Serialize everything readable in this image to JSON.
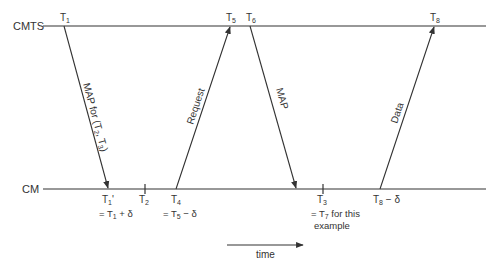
{
  "lines": {
    "cmts_label": "CMTS",
    "cm_label": "CM"
  },
  "top_marks": {
    "t1": {
      "base": "T",
      "sub": "1"
    },
    "t5": {
      "base": "T",
      "sub": "5"
    },
    "t6": {
      "base": "T",
      "sub": "6"
    },
    "t8": {
      "base": "T",
      "sub": "8"
    }
  },
  "bottom_marks": {
    "t1p": {
      "base": "T",
      "sub": "1",
      "suffix": "'",
      "note_prefix": "= T",
      "note_sub": "1",
      "note_suffix": " + δ"
    },
    "t2": {
      "base": "T",
      "sub": "2"
    },
    "t4": {
      "base": "T",
      "sub": "4",
      "note_prefix": "= T",
      "note_sub": "5",
      "note_suffix": " − δ"
    },
    "t3": {
      "base": "T",
      "sub": "3",
      "note_prefix": "= T",
      "note_sub": "7",
      "note_suffix": " for this",
      "note_line2": "example"
    },
    "t8d": {
      "base": "T",
      "sub": "8",
      "suffix": " − δ"
    }
  },
  "messages": {
    "map1": {
      "prefix": "MAP for (T",
      "sub1": "2",
      "mid": ", T",
      "sub2": "3",
      "suffix": ")"
    },
    "request": "Request",
    "map2": "MAP",
    "data": "Data"
  },
  "time_axis": {
    "label": "time"
  },
  "colors": {
    "line": "#333333",
    "text": "#333333",
    "background": "#ffffff"
  }
}
